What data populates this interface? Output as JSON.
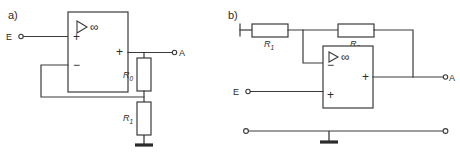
{
  "figure": {
    "background_color": "#ffffff",
    "line_color": "#3a3a3a",
    "text_color": "#2b2b2b"
  },
  "panels": [
    {
      "id": "a",
      "label": "a)",
      "description": "Non-inverting amplifier with voltage divider feedback",
      "opamp": {
        "gain_symbol": "∞",
        "triangle_icon": "amplifier-triangle-icon",
        "input_top_sign": "+",
        "input_bottom_sign": "−",
        "output_sign": "+"
      },
      "terminals": [
        {
          "name": "input",
          "label": "E"
        },
        {
          "name": "output",
          "label": "A"
        }
      ],
      "resistors": [
        {
          "name": "r0",
          "label": "R",
          "subscript": "0",
          "orientation": "vertical"
        },
        {
          "name": "r1",
          "label": "R",
          "subscript": "1",
          "orientation": "vertical"
        }
      ],
      "ground": {
        "name": "ground-symbol",
        "count": 1
      }
    },
    {
      "id": "b",
      "label": "b)",
      "description": "Inverting amplifier with series input resistor and feedback resistor",
      "opamp": {
        "gain_symbol": "∞",
        "triangle_icon": "amplifier-triangle-icon",
        "input_top_sign": "−",
        "input_bottom_sign": "+",
        "output_sign": "+"
      },
      "terminals": [
        {
          "name": "input",
          "label": "E"
        },
        {
          "name": "output",
          "label": "A"
        }
      ],
      "resistors": [
        {
          "name": "r1",
          "label": "R",
          "subscript": "1",
          "orientation": "horizontal"
        },
        {
          "name": "r0",
          "label": "R",
          "subscript": "0",
          "orientation": "horizontal"
        }
      ],
      "ground": {
        "name": "ground-symbol",
        "count": 1
      },
      "rail": {
        "name": "ground-rail",
        "left_terminal": true,
        "right_terminal": true
      }
    }
  ]
}
